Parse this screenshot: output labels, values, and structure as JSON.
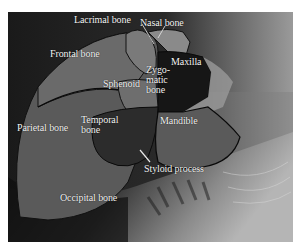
{
  "figure": {
    "labels": [
      {
        "id": "lacrimal",
        "text": "Lacrimal bone"
      },
      {
        "id": "nasal",
        "text": "Nasal bone"
      },
      {
        "id": "frontal",
        "text": "Frontal bone"
      },
      {
        "id": "zygomatic",
        "text": "Zygo-\nmatic\nbone",
        "lines": [
          "Zygo-",
          "matic",
          "bone"
        ]
      },
      {
        "id": "maxilla",
        "text": "Maxilla"
      },
      {
        "id": "sphenoid",
        "text": "Sphenoid"
      },
      {
        "id": "temporal",
        "text": "Temporal bone",
        "lines": [
          "Temporal",
          "bone"
        ]
      },
      {
        "id": "parietal",
        "text": "Parietal bone"
      },
      {
        "id": "mandible",
        "text": "Mandible"
      },
      {
        "id": "styloid",
        "text": "Styloid process"
      },
      {
        "id": "occipital",
        "text": "Occipital bone"
      }
    ]
  }
}
